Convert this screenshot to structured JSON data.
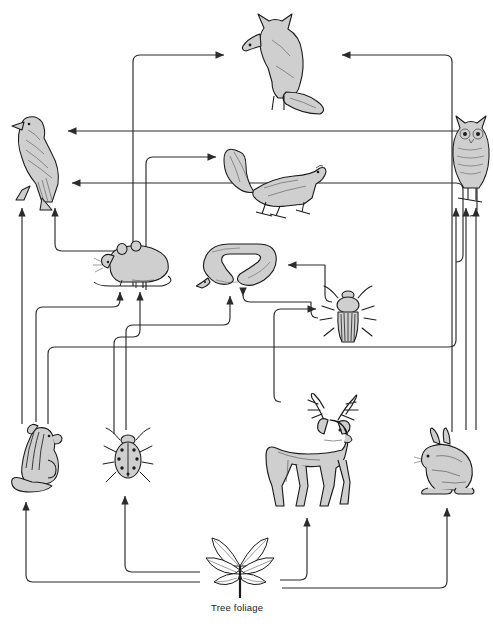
{
  "diagram": {
    "type": "food-web",
    "background": "#ffffff",
    "line_color": "#2b2b2b",
    "fill_color": "#cfcfcf",
    "stroke_color": "#1a1a1a",
    "caption_text": "Tree foliage"
  },
  "organisms": [
    {
      "id": "fox",
      "label": "fox",
      "icon": "fox-icon",
      "x": 228,
      "y": 8,
      "w": 110,
      "h": 108,
      "trophic": "top-predator"
    },
    {
      "id": "hawk",
      "label": "hawk",
      "icon": "hawk-icon",
      "x": 2,
      "y": 110,
      "w": 74,
      "h": 100,
      "trophic": "top-predator"
    },
    {
      "id": "owl",
      "label": "owl",
      "icon": "owl-icon",
      "x": 448,
      "y": 112,
      "w": 44,
      "h": 92,
      "trophic": "top-predator"
    },
    {
      "id": "squirrel",
      "label": "squirrel",
      "icon": "squirrel-icon",
      "x": 218,
      "y": 140,
      "w": 112,
      "h": 80,
      "trophic": "primary-consumer"
    },
    {
      "id": "mouse",
      "label": "mouse",
      "icon": "mouse-icon",
      "x": 94,
      "y": 238,
      "w": 84,
      "h": 50,
      "trophic": "primary-consumer"
    },
    {
      "id": "snake",
      "label": "snake",
      "icon": "snake-icon",
      "x": 198,
      "y": 238,
      "w": 86,
      "h": 56,
      "trophic": "secondary-consumer"
    },
    {
      "id": "beetle",
      "label": "bark beetle",
      "icon": "beetle-icon",
      "x": 320,
      "y": 286,
      "w": 56,
      "h": 60,
      "trophic": "primary-consumer"
    },
    {
      "id": "chipmunk",
      "label": "chipmunk",
      "icon": "chipmunk-icon",
      "x": 10,
      "y": 422,
      "w": 56,
      "h": 72,
      "trophic": "primary-consumer"
    },
    {
      "id": "ladybug",
      "label": "spotted beetle",
      "icon": "ladybug-icon",
      "x": 104,
      "y": 428,
      "w": 48,
      "h": 60,
      "trophic": "primary-consumer"
    },
    {
      "id": "deer",
      "label": "deer",
      "icon": "deer-icon",
      "x": 262,
      "y": 392,
      "w": 110,
      "h": 118,
      "trophic": "primary-consumer"
    },
    {
      "id": "rabbit",
      "label": "rabbit",
      "icon": "rabbit-icon",
      "x": 414,
      "y": 428,
      "w": 64,
      "h": 74,
      "trophic": "primary-consumer"
    },
    {
      "id": "foliage",
      "label": "Tree foliage",
      "icon": "foliage-icon",
      "x": 198,
      "y": 534,
      "w": 84,
      "h": 66,
      "trophic": "producer"
    }
  ],
  "links": [
    {
      "from": "mouse",
      "to": "fox",
      "path": "M133,284 L133,62 Q133,55 140,55 L218,55"
    },
    {
      "from": "rabbit",
      "to": "fox",
      "path": "M452,430 L452,62 Q452,55 445,55 L345,55"
    },
    {
      "from": "mouse",
      "to": "hawk",
      "path": "M143,286 L143,260 Q143,253 136,253 L60,253 Q53,253 53,246 L53,206"
    },
    {
      "from": "squirrel",
      "to": "hawk",
      "path": "M466,215 Q473,215 473,208 L473,138 Q473,131 466,131 L72,131"
    },
    {
      "from": "snake",
      "to": "hawk",
      "path": "M470,258 Q477,258 477,251 L477,190 Q477,183 470,183 L72,183"
    },
    {
      "from": "chipmunk",
      "to": "hawk",
      "path": "M22,424 L22,206"
    },
    {
      "from": "mouse",
      "to": "squirrel",
      "path": "M146,290 L146,164 Q146,157 153,157 L218,157"
    },
    {
      "from": "beetle",
      "to": "snake",
      "path": "M330,300 Q323,300 323,293 L323,265 L286,265"
    },
    {
      "from": "ladybug",
      "to": "snake",
      "path": "M128,430 L128,330 Q128,323 135,323 L223,323 Q230,323 230,316 L230,294"
    },
    {
      "from": "beetle",
      "to": "snake2",
      "path": "M316,316 Q309,316 309,309 L309,300 L247,300 Q240,300 240,293 L240,294"
    },
    {
      "from": "chipmunk",
      "to": "mouse",
      "path": "M36,422 L36,312 Q36,305 43,305 L113,305 Q120,305 120,298 L120,290"
    },
    {
      "from": "ladybug",
      "to": "mouse",
      "path": "M116,432 L116,342 Q116,335 123,335 L133,335 Q140,335 140,328 L140,290"
    },
    {
      "from": "chipmunk",
      "to": "owl",
      "path": "M48,424 L48,352 Q48,345 55,345 L449,345 Q456,345 456,338 L456,206"
    },
    {
      "from": "rabbit",
      "to": "owl",
      "path": "M466,430 L466,206"
    },
    {
      "from": "rabbit",
      "to": "owl2",
      "path": "M476,430 L476,206"
    },
    {
      "from": "deer",
      "to": "beetle",
      "path": "M281,400 Q274,400 274,393 L274,314 Q274,307 281,307 L313,307"
    },
    {
      "from": "foliage",
      "to": "chipmunk",
      "path": "M198,580 L33,580 Q26,580 26,573 L26,500"
    },
    {
      "from": "foliage",
      "to": "ladybug",
      "path": "M198,572 L132,572 Q125,572 125,565 L125,496"
    },
    {
      "from": "foliage",
      "to": "deer",
      "path": "M282,580 L302,580 L302,518"
    },
    {
      "from": "foliage",
      "to": "rabbit",
      "path": "M282,588 L440,588 Q447,588 447,581 L447,508"
    }
  ]
}
